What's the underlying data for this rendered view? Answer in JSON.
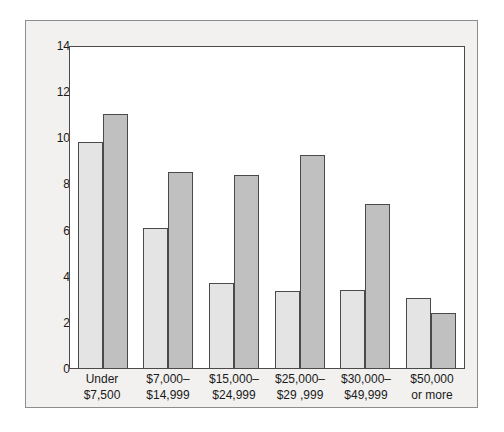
{
  "chart_data": {
    "type": "bar",
    "title": "",
    "subtitle": "",
    "xlabel": "",
    "ylabel": "",
    "ylim": [
      0,
      14
    ],
    "yticks": [
      0,
      2,
      4,
      6,
      8,
      10,
      12,
      14
    ],
    "ytick_labels": [
      "0",
      "2",
      "4",
      "6",
      "8",
      "10",
      "12",
      "14"
    ],
    "grid": false,
    "legend_position": "top-center",
    "categories": [
      "Under\n$7,500",
      "$7,000–\n$14,999",
      "$15,000–\n$24,999",
      "$25,000–\n$29 ,999",
      "$30,000–\n$49,999",
      "$50,000\nor more"
    ],
    "series": [
      {
        "name": "White",
        "color": "#e4e4e4",
        "values": [
          9.8,
          6.05,
          3.7,
          3.35,
          3.4,
          3.05
        ]
      },
      {
        "name": "Black",
        "color": "#c0c0c0",
        "values": [
          11.0,
          8.5,
          8.35,
          9.25,
          7.1,
          2.4
        ]
      }
    ]
  },
  "colors": {
    "frame_background": "#f2f1ef",
    "frame_border": "#8d8d8d",
    "plot_background": "#ffffff",
    "plot_border": "#4a4a4a",
    "bar_outline": "#4a4a4a",
    "text": "#1a1a1a"
  }
}
